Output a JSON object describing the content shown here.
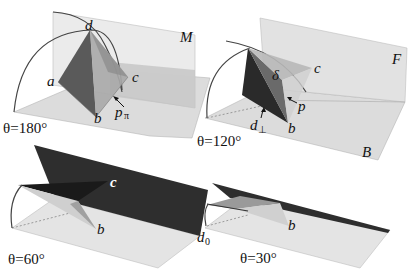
{
  "figure": {
    "panels": [
      {
        "id": "theta-180",
        "angle_label": "θ=180°",
        "points": {
          "a": "a",
          "b": "b",
          "c": "c",
          "d": "d",
          "p": "p",
          "p_sub": "π"
        },
        "plane_label": "M"
      },
      {
        "id": "theta-120",
        "angle_label": "θ=120°",
        "points": {
          "b": "b",
          "c": "c",
          "delta": "δ",
          "p": "p",
          "d": "d",
          "d_sub": "⊥"
        },
        "plane_labels": {
          "fold": "F",
          "base": "B"
        }
      },
      {
        "id": "theta-60",
        "angle_label": "θ=60°",
        "points": {
          "b": "b",
          "c": "c"
        }
      },
      {
        "id": "theta-30",
        "angle_label": "θ=30°",
        "points": {
          "b": "b",
          "d": "d",
          "d_sub": "0"
        }
      }
    ]
  }
}
